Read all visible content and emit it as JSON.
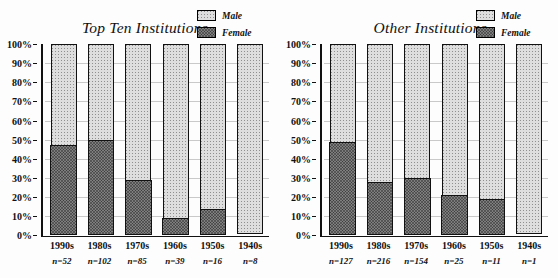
{
  "chart_data": [
    {
      "type": "bar",
      "stacked": true,
      "panel": "left",
      "title": "Top Ten Institutions",
      "xlabel": "",
      "ylabel": "",
      "ylim": [
        0,
        100
      ],
      "ytick_labels": [
        "100%",
        "90%",
        "80%",
        "70%",
        "60%",
        "50%",
        "40%",
        "30%",
        "20%",
        "10%",
        "0%"
      ],
      "ytick_values": [
        100,
        90,
        80,
        70,
        60,
        50,
        40,
        30,
        20,
        10,
        0
      ],
      "grid": true,
      "legend_position": "top-right",
      "categories": [
        "1990s",
        "1980s",
        "1970s",
        "1960s",
        "1950s",
        "1940s"
      ],
      "sample_sizes": [
        "n=52",
        "n=102",
        "n=85",
        "n=39",
        "n=16",
        "n=8"
      ],
      "sample_size_values": [
        52,
        102,
        85,
        39,
        16,
        8
      ],
      "series": [
        {
          "name": "Female",
          "values": [
            46,
            49,
            28,
            8,
            13,
            0
          ]
        },
        {
          "name": "Male",
          "values": [
            54,
            51,
            72,
            92,
            87,
            100
          ]
        }
      ]
    },
    {
      "type": "bar",
      "stacked": true,
      "panel": "right",
      "title": "Other Institutions",
      "xlabel": "",
      "ylabel": "",
      "ylim": [
        0,
        100
      ],
      "ytick_labels": [
        "100%",
        "90%",
        "80%",
        "70%",
        "60%",
        "50%",
        "40%",
        "30%",
        "20%",
        "10%",
        "0%"
      ],
      "ytick_values": [
        100,
        90,
        80,
        70,
        60,
        50,
        40,
        30,
        20,
        10,
        0
      ],
      "grid": true,
      "legend_position": "top-right",
      "categories": [
        "1990s",
        "1980s",
        "1970s",
        "1960s",
        "1950s",
        "1940s"
      ],
      "sample_sizes": [
        "n=127",
        "n=216",
        "n=154",
        "n=25",
        "n=11",
        "n=1"
      ],
      "sample_size_values": [
        127,
        216,
        154,
        25,
        11,
        1
      ],
      "series": [
        {
          "name": "Female",
          "values": [
            48,
            27,
            29,
            20,
            18,
            0
          ]
        },
        {
          "name": "Male",
          "values": [
            52,
            73,
            71,
            80,
            82,
            100
          ]
        }
      ]
    }
  ],
  "legend": {
    "male_label": "Male",
    "female_label": "Female",
    "male_color": "#dedede",
    "female_color": "#7e7e7e"
  },
  "axis": {
    "tick_labels": [
      "100%",
      "90%",
      "80%",
      "70%",
      "60%",
      "50%",
      "40%",
      "30%",
      "20%",
      "10%",
      "0%"
    ]
  }
}
